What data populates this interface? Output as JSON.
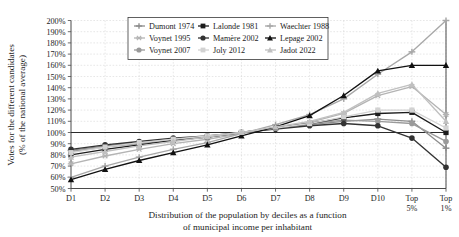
{
  "chart_data": {
    "type": "line",
    "title": "",
    "xlabel": "Distribution of the population by deciles as a function of municipal income per inhabitant",
    "xlabel_line1": "Distribution of the population by deciles as a function",
    "xlabel_line2": "of municipal income per inhabitant",
    "ylabel": "Votes for the different candidates (% of the national average)",
    "ylabel_line1": "Votes for the different candidates",
    "ylabel_line2": "(% of the national average)",
    "categories": [
      "D1",
      "D2",
      "D3",
      "D4",
      "D5",
      "D6",
      "D7",
      "D8",
      "D9",
      "D10",
      "Top 5%",
      "Top 1%"
    ],
    "xtick_labels": [
      "D1",
      "D2",
      "D3",
      "D4",
      "D5",
      "D6",
      "D7",
      "D8",
      "D9",
      "D10",
      "Top\n5%",
      "Top\n1%"
    ],
    "ylim": [
      50,
      200
    ],
    "ytick_values": [
      50,
      60,
      70,
      80,
      90,
      100,
      110,
      120,
      130,
      140,
      150,
      160,
      170,
      180,
      190,
      200
    ],
    "ytick_labels": [
      "50%",
      "60%",
      "70%",
      "80%",
      "90%",
      "100%",
      "110%",
      "120%",
      "130%",
      "140%",
      "150%",
      "160%",
      "170%",
      "180%",
      "190%",
      "200%"
    ],
    "grid": true,
    "legend_position": "top-center",
    "reference_line": 100,
    "series": [
      {
        "name": "Dumont 1974",
        "color": "#8d8d8d",
        "marker": "cross",
        "values": [
          84,
          88,
          91,
          94,
          96,
          100,
          104,
          107,
          110,
          112,
          110,
          86
        ]
      },
      {
        "name": "Voynet 1995",
        "color": "#b4b4b4",
        "marker": "star",
        "values": [
          72,
          79,
          85,
          90,
          94,
          99,
          104,
          109,
          117,
          133,
          141,
          116
        ]
      },
      {
        "name": "Voynet 2007",
        "color": "#9a9a9a",
        "marker": "circle",
        "values": [
          83,
          87,
          90,
          93,
          96,
          100,
          104,
          108,
          111,
          110,
          108,
          92
        ]
      },
      {
        "name": "Lalonde 1981",
        "color": "#1c1c1c",
        "marker": "square",
        "values": [
          80,
          85,
          89,
          93,
          96,
          100,
          104,
          108,
          113,
          117,
          118,
          100
        ]
      },
      {
        "name": "Mamère 2002",
        "color": "#333333",
        "marker": "circle",
        "values": [
          85,
          89,
          92,
          95,
          97,
          100,
          103,
          106,
          108,
          106,
          95,
          69
        ]
      },
      {
        "name": "Joly 2012",
        "color": "#d2d2d2",
        "marker": "square",
        "values": [
          82,
          87,
          91,
          94,
          97,
          100,
          104,
          108,
          114,
          120,
          120,
          104
        ]
      },
      {
        "name": "Waechter 1988",
        "color": "#a8a8a8",
        "marker": "cross",
        "values": [
          60,
          70,
          78,
          85,
          91,
          99,
          107,
          116,
          130,
          152,
          172,
          200
        ]
      },
      {
        "name": "Lepage 2002",
        "color": "#111111",
        "marker": "triangle",
        "values": [
          58,
          67,
          75,
          82,
          89,
          97,
          105,
          115,
          133,
          155,
          160,
          160
        ]
      },
      {
        "name": "Jadot 2022",
        "color": "#c0c0c0",
        "marker": "triangle",
        "values": [
          78,
          83,
          88,
          92,
          96,
          100,
          105,
          110,
          118,
          135,
          143,
          110
        ]
      }
    ]
  }
}
